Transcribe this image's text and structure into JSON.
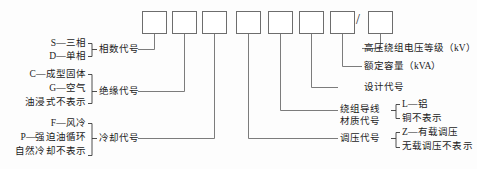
{
  "diagram": {
    "type": "transformer-model-designation",
    "slash_separator": "/",
    "boxes": [
      {
        "index": 1,
        "name": "phase-code-box"
      },
      {
        "index": 2,
        "name": "insulation-code-box"
      },
      {
        "index": 3,
        "name": "cooling-code-box"
      },
      {
        "index": 4,
        "name": "voltage-regulation-code-box"
      },
      {
        "index": 5,
        "name": "winding-conductor-material-code-box"
      },
      {
        "index": 6,
        "name": "design-code-box"
      },
      {
        "index": 7,
        "name": "rated-capacity-box"
      },
      {
        "index": 8,
        "name": "hv-winding-voltage-class-box"
      }
    ]
  },
  "left_groups": [
    {
      "title": "相数代号",
      "options": [
        "S—三相",
        "D—单相"
      ]
    },
    {
      "title": "绝缘代号",
      "options": [
        "C—成型固体",
        "G—空气",
        "油浸式不表示"
      ]
    },
    {
      "title": "冷却代号",
      "options": [
        "F—风冷",
        "P—强迫油循环",
        "自然冷却不表示"
      ]
    }
  ],
  "right_groups": [
    {
      "title": "高压绕组电压等级（kV）",
      "title_line2": "",
      "options": []
    },
    {
      "title": "额定容量（kVA）",
      "title_line2": "",
      "options": []
    },
    {
      "title": "设计代号",
      "title_line2": "",
      "options": []
    },
    {
      "title": "绕组导线",
      "title_line2": "材质代号",
      "options": [
        "L—铝",
        "铜不表示"
      ]
    },
    {
      "title": "调压代号",
      "title_line2": "",
      "options": [
        "Z—有载调压",
        "无载调压不表示"
      ]
    }
  ],
  "colors": {
    "background": "#fdfdfd",
    "line": "#6d6d6d",
    "brace": "#3a3a3a",
    "text": "#1b1b1b"
  }
}
